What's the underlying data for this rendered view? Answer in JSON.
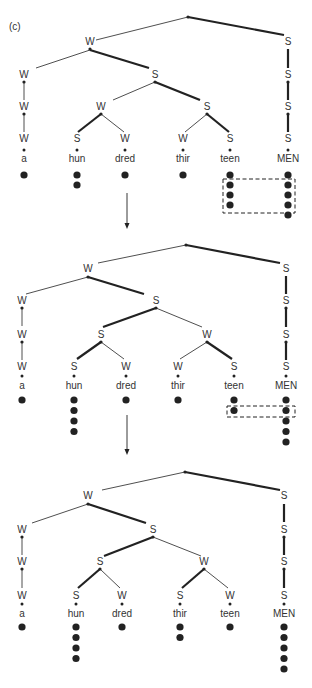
{
  "figure": {
    "panel_label": "(c)",
    "colors": {
      "ink": "#222222",
      "text": "#333333",
      "background": "#ffffff"
    }
  },
  "syllables": [
    "a",
    "hun",
    "dred",
    "thir",
    "teen",
    "MEN"
  ],
  "trees": [
    {
      "id": "tree-1",
      "offset_y": 0,
      "root": [
        188,
        17
      ],
      "branches": [
        {
          "from": [
            188,
            17
          ],
          "to": [
            96,
            40
          ],
          "strong": false
        },
        {
          "from": [
            188,
            17
          ],
          "to": [
            284,
            35
          ],
          "strong": true
        },
        {
          "from": [
            90,
            50
          ],
          "to": [
            36,
            68
          ],
          "strong": false
        },
        {
          "from": [
            90,
            50
          ],
          "to": [
            149,
            68
          ],
          "strong": true
        },
        {
          "from": [
            155,
            82
          ],
          "to": [
            113,
            100
          ],
          "strong": false
        },
        {
          "from": [
            155,
            82
          ],
          "to": [
            200,
            100
          ],
          "strong": true
        },
        {
          "from": [
            101,
            114
          ],
          "to": [
            78,
            132
          ],
          "strong": true
        },
        {
          "from": [
            101,
            114
          ],
          "to": [
            124,
            132
          ],
          "strong": false
        },
        {
          "from": [
            207,
            114
          ],
          "to": [
            185,
            132
          ],
          "strong": false
        },
        {
          "from": [
            207,
            114
          ],
          "to": [
            229,
            132
          ],
          "strong": true
        },
        {
          "from": [
            24,
            82
          ],
          "to": [
            24,
            100
          ],
          "strong": false
        },
        {
          "from": [
            24,
            114
          ],
          "to": [
            24,
            132
          ],
          "strong": false
        },
        {
          "from": [
            288,
            49
          ],
          "to": [
            288,
            68
          ],
          "strong": true
        },
        {
          "from": [
            288,
            82
          ],
          "to": [
            288,
            100
          ],
          "strong": true
        },
        {
          "from": [
            288,
            114
          ],
          "to": [
            288,
            132
          ],
          "strong": true
        }
      ],
      "nodes": [
        {
          "label": "W",
          "x": 90,
          "y": 45
        },
        {
          "label": "S",
          "x": 288,
          "y": 45
        },
        {
          "label": "W",
          "x": 24,
          "y": 78
        },
        {
          "label": "S",
          "x": 155,
          "y": 78
        },
        {
          "label": "S",
          "x": 288,
          "y": 78
        },
        {
          "label": "W",
          "x": 24,
          "y": 110
        },
        {
          "label": "W",
          "x": 101,
          "y": 110
        },
        {
          "label": "S",
          "x": 207,
          "y": 110
        },
        {
          "label": "S",
          "x": 288,
          "y": 110
        },
        {
          "label": "W",
          "x": 24,
          "y": 142
        },
        {
          "label": "S",
          "x": 77,
          "y": 142
        },
        {
          "label": "W",
          "x": 125,
          "y": 142
        },
        {
          "label": "W",
          "x": 183,
          "y": 142
        },
        {
          "label": "S",
          "x": 230,
          "y": 142
        },
        {
          "label": "S",
          "x": 288,
          "y": 142
        }
      ],
      "node_dots": [
        [
          90,
          49
        ],
        [
          24,
          82
        ],
        [
          155,
          82
        ],
        [
          288,
          82
        ],
        [
          24,
          114
        ],
        [
          101,
          114
        ],
        [
          207,
          114
        ],
        [
          288,
          114
        ],
        [
          188,
          17
        ]
      ],
      "leaf_x": [
        24,
        77,
        125,
        183,
        230,
        288
      ],
      "small_dot_y": 150,
      "syllable_y": 162,
      "grid_start_y": 175,
      "grid_step": 10,
      "grid_heights": [
        1,
        2,
        1,
        1,
        4,
        5
      ],
      "dashed_box": {
        "x": 223,
        "y": 179,
        "w": 72,
        "h": 34
      },
      "arrow": {
        "x": 127,
        "y1": 193,
        "y2": 229
      }
    },
    {
      "id": "tree-2",
      "offset_y": 0,
      "root": [
        186,
        245
      ],
      "branches": [
        {
          "from": [
            186,
            245
          ],
          "to": [
            98,
            263
          ],
          "strong": false
        },
        {
          "from": [
            186,
            245
          ],
          "to": [
            280,
            263
          ],
          "strong": true
        },
        {
          "from": [
            88,
            277
          ],
          "to": [
            26,
            294
          ],
          "strong": false
        },
        {
          "from": [
            88,
            277
          ],
          "to": [
            144,
            294
          ],
          "strong": true
        },
        {
          "from": [
            156,
            308
          ],
          "to": [
            103,
            327
          ],
          "strong": true
        },
        {
          "from": [
            156,
            308
          ],
          "to": [
            202,
            327
          ],
          "strong": false
        },
        {
          "from": [
            101,
            342
          ],
          "to": [
            77,
            359
          ],
          "strong": true
        },
        {
          "from": [
            101,
            342
          ],
          "to": [
            124,
            359
          ],
          "strong": false
        },
        {
          "from": [
            207,
            342
          ],
          "to": [
            180,
            359
          ],
          "strong": false
        },
        {
          "from": [
            207,
            342
          ],
          "to": [
            232,
            359
          ],
          "strong": true
        },
        {
          "from": [
            22,
            308
          ],
          "to": [
            22,
            326
          ],
          "strong": false
        },
        {
          "from": [
            22,
            342
          ],
          "to": [
            22,
            360
          ],
          "strong": false
        },
        {
          "from": [
            286,
            276
          ],
          "to": [
            286,
            294
          ],
          "strong": true
        },
        {
          "from": [
            286,
            308
          ],
          "to": [
            286,
            327
          ],
          "strong": true
        },
        {
          "from": [
            286,
            342
          ],
          "to": [
            286,
            360
          ],
          "strong": true
        }
      ],
      "nodes": [
        {
          "label": "W",
          "x": 88,
          "y": 272
        },
        {
          "label": "S",
          "x": 286,
          "y": 272
        },
        {
          "label": "W",
          "x": 22,
          "y": 304
        },
        {
          "label": "S",
          "x": 156,
          "y": 304
        },
        {
          "label": "S",
          "x": 286,
          "y": 304
        },
        {
          "label": "W",
          "x": 22,
          "y": 338
        },
        {
          "label": "S",
          "x": 101,
          "y": 338
        },
        {
          "label": "W",
          "x": 207,
          "y": 338
        },
        {
          "label": "S",
          "x": 286,
          "y": 338
        },
        {
          "label": "W",
          "x": 22,
          "y": 370
        },
        {
          "label": "S",
          "x": 74,
          "y": 370
        },
        {
          "label": "W",
          "x": 126,
          "y": 370
        },
        {
          "label": "W",
          "x": 178,
          "y": 370
        },
        {
          "label": "S",
          "x": 234,
          "y": 370
        },
        {
          "label": "S",
          "x": 286,
          "y": 370
        }
      ],
      "node_dots": [
        [
          88,
          277
        ],
        [
          22,
          308
        ],
        [
          156,
          308
        ],
        [
          286,
          308
        ],
        [
          22,
          342
        ],
        [
          101,
          342
        ],
        [
          207,
          342
        ],
        [
          286,
          342
        ],
        [
          186,
          245
        ]
      ],
      "leaf_x": [
        22,
        74,
        126,
        178,
        234,
        286
      ],
      "small_dot_y": 376,
      "syllable_y": 389,
      "grid_start_y": 400,
      "grid_step": 10.5,
      "grid_heights": [
        1,
        4,
        1,
        1,
        2,
        5
      ],
      "dashed_box": {
        "x": 227,
        "y": 406,
        "w": 68,
        "h": 11
      },
      "arrow": {
        "x": 127,
        "y1": 415,
        "y2": 455
      }
    },
    {
      "id": "tree-3",
      "offset_y": 0,
      "root": [
        185,
        472
      ],
      "branches": [
        {
          "from": [
            185,
            472
          ],
          "to": [
            102,
            490
          ],
          "strong": false
        },
        {
          "from": [
            185,
            472
          ],
          "to": [
            280,
            490
          ],
          "strong": true
        },
        {
          "from": [
            88,
            504
          ],
          "to": [
            32,
            523
          ],
          "strong": false
        },
        {
          "from": [
            88,
            504
          ],
          "to": [
            146,
            523
          ],
          "strong": true
        },
        {
          "from": [
            153,
            537
          ],
          "to": [
            104,
            556
          ],
          "strong": true
        },
        {
          "from": [
            153,
            537
          ],
          "to": [
            201,
            556
          ],
          "strong": false
        },
        {
          "from": [
            100,
            569
          ],
          "to": [
            78,
            588
          ],
          "strong": true
        },
        {
          "from": [
            100,
            569
          ],
          "to": [
            120,
            588
          ],
          "strong": false
        },
        {
          "from": [
            204,
            569
          ],
          "to": [
            182,
            588
          ],
          "strong": true
        },
        {
          "from": [
            204,
            569
          ],
          "to": [
            228,
            588
          ],
          "strong": false
        },
        {
          "from": [
            22,
            537
          ],
          "to": [
            22,
            555
          ],
          "strong": false
        },
        {
          "from": [
            22,
            569
          ],
          "to": [
            22,
            588
          ],
          "strong": false
        },
        {
          "from": [
            284,
            504
          ],
          "to": [
            284,
            522
          ],
          "strong": true
        },
        {
          "from": [
            284,
            537
          ],
          "to": [
            284,
            555
          ],
          "strong": true
        },
        {
          "from": [
            284,
            569
          ],
          "to": [
            284,
            588
          ],
          "strong": true
        }
      ],
      "nodes": [
        {
          "label": "W",
          "x": 88,
          "y": 499
        },
        {
          "label": "S",
          "x": 284,
          "y": 499
        },
        {
          "label": "W",
          "x": 22,
          "y": 533
        },
        {
          "label": "S",
          "x": 153,
          "y": 533
        },
        {
          "label": "S",
          "x": 284,
          "y": 533
        },
        {
          "label": "W",
          "x": 22,
          "y": 565
        },
        {
          "label": "S",
          "x": 100,
          "y": 565
        },
        {
          "label": "W",
          "x": 204,
          "y": 565
        },
        {
          "label": "S",
          "x": 284,
          "y": 565
        },
        {
          "label": "W",
          "x": 22,
          "y": 599
        },
        {
          "label": "S",
          "x": 76,
          "y": 599
        },
        {
          "label": "W",
          "x": 122,
          "y": 599
        },
        {
          "label": "S",
          "x": 180,
          "y": 599
        },
        {
          "label": "W",
          "x": 230,
          "y": 599
        },
        {
          "label": "S",
          "x": 284,
          "y": 599
        }
      ],
      "node_dots": [
        [
          88,
          504
        ],
        [
          22,
          537
        ],
        [
          153,
          537
        ],
        [
          284,
          537
        ],
        [
          22,
          569
        ],
        [
          100,
          569
        ],
        [
          204,
          569
        ],
        [
          284,
          569
        ],
        [
          185,
          472
        ]
      ],
      "leaf_x": [
        22,
        76,
        122,
        180,
        230,
        284
      ],
      "small_dot_y": 604,
      "syllable_y": 617,
      "grid_start_y": 627,
      "grid_step": 10.5,
      "grid_heights": [
        1,
        4,
        1,
        2,
        1,
        5
      ],
      "dashed_box": null,
      "arrow": null
    }
  ]
}
